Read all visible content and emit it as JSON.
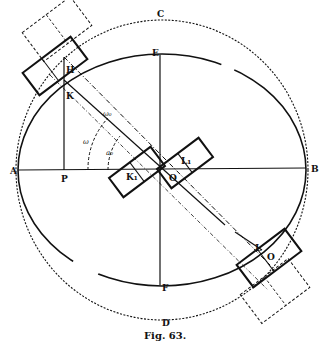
{
  "figure": {
    "caption": "Fig. 63.",
    "labels": {
      "A": "A",
      "B": "B",
      "C": "C",
      "D": "D",
      "E": "E",
      "F": "F",
      "H": "H",
      "K": "K",
      "P": "P",
      "L": "L",
      "O": "O",
      "K1": "K₁",
      "L1": "L₁",
      "O_center": "O",
      "w0": "ω₀",
      "w": "ω",
      "a0": "a₀"
    },
    "colors": {
      "ink": "#111111",
      "paper": "#ffffff"
    }
  }
}
